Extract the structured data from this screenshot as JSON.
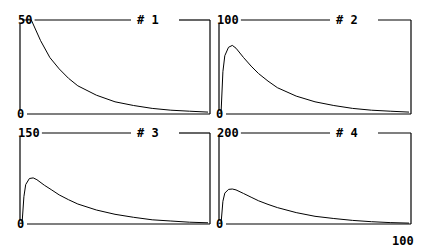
{
  "chart_data": [
    {
      "type": "line",
      "title": "# 1",
      "ylim": [
        0,
        50
      ],
      "yticks": [
        "50",
        "0"
      ],
      "xlim": [
        0,
        100
      ],
      "x": [
        0,
        5,
        10,
        15,
        20,
        25,
        30,
        40,
        50,
        60,
        70,
        80,
        90,
        100
      ],
      "values": [
        50,
        50,
        39,
        30,
        24,
        19,
        15,
        10,
        6.5,
        4.5,
        3,
        2,
        1.5,
        1
      ]
    },
    {
      "type": "line",
      "title": "# 2",
      "ylim": [
        0,
        100
      ],
      "yticks": [
        "100",
        "0"
      ],
      "xlim": [
        0,
        100
      ],
      "x": [
        0,
        1,
        2,
        4,
        6,
        8,
        12,
        16,
        20,
        25,
        30,
        40,
        50,
        60,
        70,
        80,
        90,
        100
      ],
      "values": [
        0,
        45,
        62,
        71,
        73,
        70,
        60,
        51,
        43,
        35,
        28,
        19,
        13,
        9,
        6,
        4,
        3,
        2
      ]
    },
    {
      "type": "line",
      "title": "# 3",
      "ylim": [
        0,
        150
      ],
      "yticks": [
        "150",
        "0"
      ],
      "xlim": [
        0,
        100
      ],
      "x": [
        0,
        1,
        2,
        4,
        6,
        8,
        12,
        16,
        20,
        25,
        30,
        40,
        50,
        60,
        70,
        80,
        90,
        100
      ],
      "values": [
        0,
        45,
        65,
        75,
        76,
        73,
        64,
        56,
        48,
        40,
        33,
        23,
        16,
        11,
        7,
        5,
        3,
        2
      ]
    },
    {
      "type": "line",
      "title": "# 4",
      "ylim": [
        0,
        200
      ],
      "yticks": [
        "200",
        "0"
      ],
      "xlim": [
        0,
        100
      ],
      "xticks": [
        "100"
      ],
      "x": [
        0,
        1,
        2,
        4,
        6,
        8,
        12,
        16,
        20,
        25,
        30,
        40,
        50,
        60,
        70,
        80,
        90,
        100
      ],
      "values": [
        0,
        50,
        68,
        76,
        77,
        75,
        67,
        59,
        51,
        43,
        36,
        25,
        17,
        12,
        8,
        5,
        3,
        2
      ]
    }
  ],
  "x_axis_max_label": "100"
}
